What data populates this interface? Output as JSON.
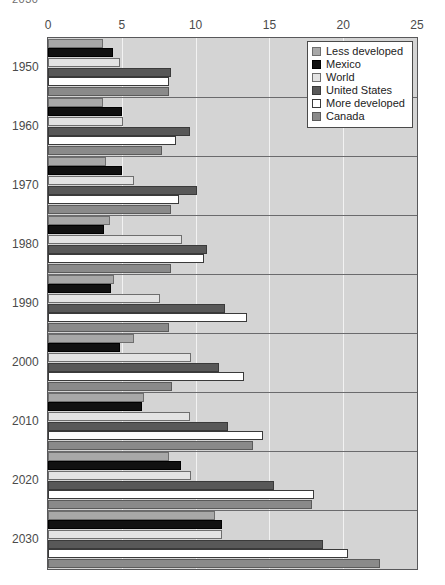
{
  "title_fragment": "2030",
  "chart_data": {
    "type": "bar",
    "orientation": "horizontal",
    "title": "",
    "xlabel": "",
    "ylabel": "",
    "xlim": [
      0,
      25
    ],
    "xticks": [
      0,
      5,
      10,
      15,
      20,
      25
    ],
    "grid": true,
    "legend_position": "top-right",
    "categories": [
      "1950",
      "1960",
      "1970",
      "1980",
      "1990",
      "2000",
      "2010",
      "2020",
      "2030"
    ],
    "series": [
      {
        "name": "Less developed",
        "color": "#a8a8a8",
        "values": [
          3.7,
          3.7,
          3.9,
          4.2,
          4.5,
          5.8,
          6.5,
          8.2,
          11.3
        ]
      },
      {
        "name": "Mexico",
        "color": "#111111",
        "values": [
          4.4,
          5.0,
          5.0,
          3.8,
          4.3,
          4.9,
          6.4,
          9.0,
          11.8
        ]
      },
      {
        "name": "World",
        "color": "#e3e3e3",
        "values": [
          4.9,
          5.1,
          5.8,
          9.1,
          7.6,
          9.7,
          9.6,
          9.7,
          11.8
        ]
      },
      {
        "name": "United States",
        "color": "#585858",
        "values": [
          8.3,
          9.6,
          10.1,
          10.8,
          12.0,
          11.6,
          12.2,
          15.3,
          18.6
        ]
      },
      {
        "name": "More developed",
        "color": "#ffffff",
        "values": [
          8.2,
          8.7,
          8.9,
          10.6,
          13.5,
          13.3,
          14.6,
          18.0,
          20.3
        ]
      },
      {
        "name": "Canada",
        "color": "#8a8a8a",
        "values": [
          8.2,
          7.7,
          8.3,
          8.3,
          8.2,
          8.4,
          13.9,
          17.9,
          22.5
        ]
      }
    ]
  }
}
